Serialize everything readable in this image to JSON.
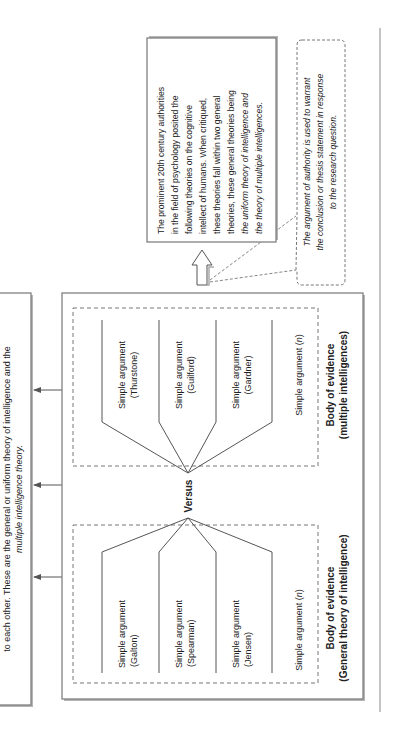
{
  "page": {
    "orientation": "rotated-90-ccw",
    "colors": {
      "line": "#555555",
      "box_border": "#777777",
      "shadow": "#b5b5b5",
      "text": "#222222",
      "background": "#ffffff"
    }
  },
  "summary_box": {
    "line1": "to each other. These are the general or uniform theory of intelligence and the",
    "line2": "multiple intelligence theory."
  },
  "main_box": {
    "versus_label": "Versus",
    "groups": [
      {
        "id": "multiple",
        "title": "Body of evidence",
        "subtitle": "(multiple intelligences)",
        "arguments": [
          {
            "line1": "Simple argument",
            "line2": "(Thurstone)"
          },
          {
            "line1": "Simple argument",
            "line2": "(Guilford)"
          },
          {
            "line1": "Simple argument",
            "line2": "(Gardner)"
          },
          {
            "line1": "Simple argument (",
            "n": "n",
            "close": ")"
          }
        ]
      },
      {
        "id": "general",
        "title": "Body of evidence",
        "subtitle": "(General theory of intelligence)",
        "arguments": [
          {
            "line1": "Simple argument",
            "line2": "(Galton)"
          },
          {
            "line1": "Simple argument",
            "line2": "(Spearman)"
          },
          {
            "line1": "Simple argument",
            "line2": "(Jensen)"
          },
          {
            "line1": "Simple argument (",
            "n": "n",
            "close": ")"
          }
        ]
      }
    ]
  },
  "conclusion_box": {
    "lines": [
      "The prominent 20th century authorities",
      "in the field of psychology posited the",
      "following theories on the cognitive",
      "intellect of humans. When critiqued,",
      "these theories fall within two general",
      "theories, these general theories being",
      "the uniform theory of intelligence and",
      "the theory of multiple intelligences."
    ]
  },
  "callout": {
    "lines": [
      "The argument of authority is used to warrant",
      "the conclusion or thesis statement in response",
      "to the research question."
    ]
  }
}
